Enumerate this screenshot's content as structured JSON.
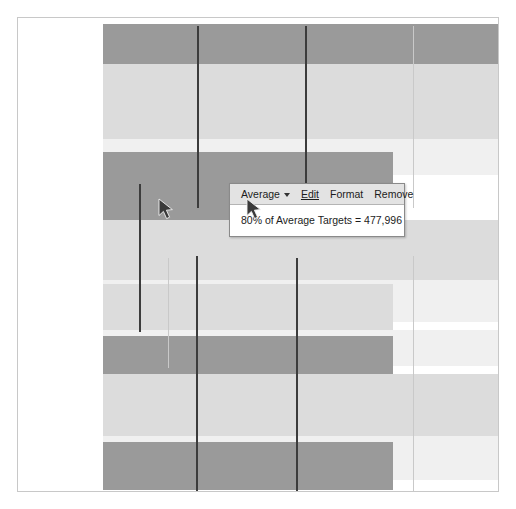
{
  "canvas": {
    "width": 516,
    "height": 509,
    "background": "#ffffff",
    "frame_border_color": "#c8c8c8"
  },
  "colors": {
    "bar_dark": "#9a9a9a",
    "bar_light": "#dcdcdc",
    "bar_pale": "#f0f0f0",
    "gridline_dark": "#3c3c3c",
    "gridline_light": "#c9c9c9",
    "tooltip_header_bg": "#e3e3e3",
    "tooltip_body_bg": "#ffffff",
    "tooltip_border": "#8a8a8a",
    "text": "#1c1c1c"
  },
  "tooltip": {
    "series_label": "Average",
    "dropdown_icon": "chevron-down-icon",
    "actions": [
      {
        "id": "edit",
        "label": "Edit"
      },
      {
        "id": "format",
        "label": "Format"
      },
      {
        "id": "remove",
        "label": "Remove"
      }
    ],
    "value_text": "80% of Average Targets = 477,996",
    "metric_percent": "80%",
    "metric_name": "Average Targets",
    "metric_value": "477,996"
  },
  "cursors": [
    {
      "name": "pointer-arrow-on-chart",
      "x": 140,
      "y": 180
    },
    {
      "name": "pointer-arrow-on-tooltip",
      "x": 228,
      "y": 180
    }
  ],
  "chart_data": {
    "type": "bar",
    "orientation": "horizontal",
    "title": "",
    "xlabel": "",
    "ylabel": "",
    "grid": true,
    "legend": "none",
    "categories": [
      "Band 1",
      "Band 2",
      "Band 3",
      "Band 4",
      "Band 5",
      "Band 6",
      "Band 7",
      "Band 8",
      "Band 9",
      "Band 10",
      "Band 11",
      "Band 12"
    ],
    "values": [
      400,
      400,
      400,
      400,
      380,
      290,
      290,
      290,
      290,
      480,
      480,
      275
    ],
    "bars": [
      {
        "category": "Band 1",
        "y": 6,
        "height": 40,
        "length": 400,
        "shade": "dark"
      },
      {
        "category": "Band 2",
        "y": 46,
        "height": 75,
        "length": 400,
        "shade": "light"
      },
      {
        "category": "Band 3",
        "y": 121,
        "height": 36,
        "length": 400,
        "shade": "pale"
      },
      {
        "category": "Band 4",
        "y": 134,
        "height": 68,
        "length": 290,
        "shade": "dark"
      },
      {
        "category": "Band 5",
        "y": 202,
        "height": 60,
        "length": 400,
        "shade": "light"
      },
      {
        "category": "Band 6",
        "y": 262,
        "height": 42,
        "length": 400,
        "shade": "pale"
      },
      {
        "category": "Band 7",
        "y": 266,
        "height": 46,
        "length": 290,
        "shade": "light"
      },
      {
        "category": "Band 8",
        "y": 312,
        "height": 36,
        "length": 400,
        "shade": "pale"
      },
      {
        "category": "Band 9",
        "y": 318,
        "height": 56,
        "length": 290,
        "shade": "dark"
      },
      {
        "category": "Band 10",
        "y": 356,
        "height": 62,
        "length": 400,
        "shade": "light"
      },
      {
        "category": "Band 11",
        "y": 418,
        "height": 44,
        "length": 400,
        "shade": "pale"
      },
      {
        "category": "Band 12",
        "y": 424,
        "height": 48,
        "length": 290,
        "shade": "dark"
      }
    ],
    "reference_lines": [
      {
        "id": "ref-line-1",
        "x": 179,
        "y": 8,
        "length": 182,
        "weight": "dark"
      },
      {
        "id": "ref-line-2",
        "x": 287,
        "y": 8,
        "length": 182,
        "weight": "dark"
      },
      {
        "id": "ref-line-3",
        "x": 395,
        "y": 8,
        "length": 182,
        "weight": "light"
      },
      {
        "id": "ref-line-4",
        "x": 121,
        "y": 166,
        "length": 148,
        "weight": "dark"
      },
      {
        "id": "ref-line-5",
        "x": 178,
        "y": 238,
        "length": 235,
        "weight": "dark"
      },
      {
        "id": "ref-line-6",
        "x": 278,
        "y": 240,
        "length": 233,
        "weight": "dark"
      },
      {
        "id": "ref-line-7",
        "x": 395,
        "y": 238,
        "length": 235,
        "weight": "light"
      },
      {
        "id": "ref-line-8",
        "x": 150,
        "y": 240,
        "length": 110,
        "weight": "light"
      }
    ]
  }
}
